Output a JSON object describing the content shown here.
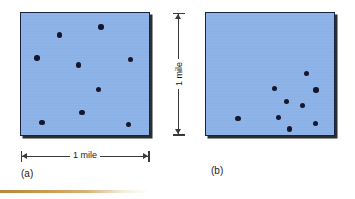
{
  "figure": {
    "colors": {
      "square_fill": "#8cb3e8",
      "square_border": "#1b2140",
      "square_shadow": "#2a2f33",
      "dot": "#14172e",
      "dimension_line": "#3a3a3a",
      "bottom_rule": "#c79a4d",
      "background": "#ffffff"
    },
    "panels": [
      {
        "id": "a",
        "caption": "(a)",
        "pattern": "uniform-scattered",
        "point_count": 9,
        "points": [
          {
            "x": 30.0,
            "y": 18.0
          },
          {
            "x": 62.5,
            "y": 11.5
          },
          {
            "x": 12.5,
            "y": 37.0
          },
          {
            "x": 45.0,
            "y": 42.5
          },
          {
            "x": 85.5,
            "y": 38.0
          },
          {
            "x": 60.5,
            "y": 62.5
          },
          {
            "x": 47.5,
            "y": 81.5
          },
          {
            "x": 16.5,
            "y": 89.5
          },
          {
            "x": 84.0,
            "y": 91.5
          }
        ]
      },
      {
        "id": "b",
        "caption": "(b)",
        "pattern": "clustered-lower-right",
        "point_count": 9,
        "points": [
          {
            "x": 78.5,
            "y": 49.5
          },
          {
            "x": 53.5,
            "y": 62.0
          },
          {
            "x": 86.0,
            "y": 63.0
          },
          {
            "x": 63.0,
            "y": 72.5
          },
          {
            "x": 75.5,
            "y": 76.0
          },
          {
            "x": 56.5,
            "y": 85.5
          },
          {
            "x": 25.0,
            "y": 86.5
          },
          {
            "x": 85.5,
            "y": 90.5
          },
          {
            "x": 65.0,
            "y": 95.0
          }
        ]
      }
    ],
    "dimensions": {
      "horizontal": {
        "label": "1 mile",
        "orientation": "horizontal"
      },
      "vertical": {
        "label": "1 mile",
        "orientation": "vertical"
      }
    }
  }
}
